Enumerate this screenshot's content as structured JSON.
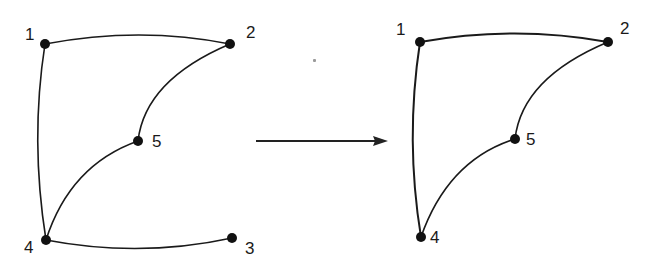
{
  "diagram": {
    "type": "graph-transformation",
    "colors": {
      "ink": "#1a1a1a",
      "background": "#ffffff"
    },
    "left_graph": {
      "nodes": [
        {
          "id": "1",
          "label": "1",
          "x": 45,
          "y": 44
        },
        {
          "id": "2",
          "label": "2",
          "x": 230,
          "y": 44
        },
        {
          "id": "3",
          "label": "3",
          "x": 232,
          "y": 238
        },
        {
          "id": "4",
          "label": "4",
          "x": 46,
          "y": 240
        },
        {
          "id": "5",
          "label": "5",
          "x": 138,
          "y": 141
        }
      ],
      "edges": [
        {
          "from": "1",
          "to": "2"
        },
        {
          "from": "1",
          "to": "4"
        },
        {
          "from": "2",
          "to": "5"
        },
        {
          "from": "5",
          "to": "4"
        },
        {
          "from": "4",
          "to": "3"
        }
      ]
    },
    "arrow": {
      "x1": 256,
      "y1": 141,
      "x2": 388,
      "y2": 141,
      "direction": "right"
    },
    "right_graph": {
      "nodes": [
        {
          "id": "1",
          "label": "1",
          "x": 420,
          "y": 42
        },
        {
          "id": "2",
          "label": "2",
          "x": 608,
          "y": 42
        },
        {
          "id": "4",
          "label": "4",
          "x": 421,
          "y": 237
        },
        {
          "id": "5",
          "label": "5",
          "x": 515,
          "y": 139
        }
      ],
      "edges": [
        {
          "from": "1",
          "to": "2"
        },
        {
          "from": "1",
          "to": "4"
        },
        {
          "from": "2",
          "to": "5"
        },
        {
          "from": "5",
          "to": "4"
        }
      ]
    }
  }
}
